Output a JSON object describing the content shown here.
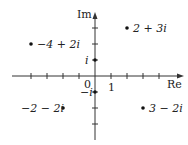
{
  "diagram": {
    "axes": {
      "x_label": "Re",
      "y_label": "Im",
      "origin_label": "0",
      "unit_label": "1",
      "origin_px": [
        95,
        76
      ],
      "unit_px": 16
    },
    "points": [
      {
        "label": "2 + 3i",
        "re": 2,
        "im": 3
      },
      {
        "label": "−4 + 2i",
        "re": -4,
        "im": 2
      },
      {
        "label": "i",
        "re": 0,
        "im": 1
      },
      {
        "label": "−i",
        "re": 0,
        "im": -1
      },
      {
        "label": "−2 − 2i",
        "re": -2,
        "im": -2
      },
      {
        "label": "3 − 2i",
        "re": 3,
        "im": -2
      }
    ]
  }
}
